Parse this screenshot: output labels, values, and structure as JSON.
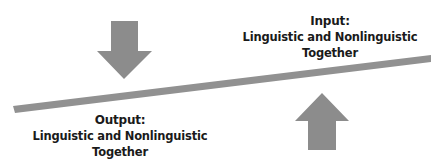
{
  "input": {
    "title": "Input:",
    "line1": "Linguistic and Nonlinguistic",
    "line2": "Together"
  },
  "output": {
    "title": "Output:",
    "line1": "Linguistic and Nonlinguistic",
    "line2": "Together"
  },
  "colors": {
    "arrow": "#8c8c8c",
    "bar": "#8f8f8f",
    "text": "#1a1a1a"
  }
}
